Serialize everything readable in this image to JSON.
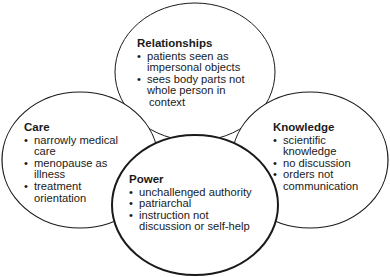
{
  "diagram": {
    "type": "overlapping-circles",
    "nodes": [
      {
        "id": "relationships",
        "title": "Relationships",
        "items": [
          "patients seen as impersonal objects",
          "sees body parts not whole person in context"
        ],
        "lines": [
          [
            "patients seen as",
            "impersonal objects"
          ],
          [
            "sees body parts not",
            "whole person in",
            " context"
          ]
        ]
      },
      {
        "id": "care",
        "title": "Care",
        "items": [
          "narrowly medical care",
          "menopause as illness",
          "treatment orientation"
        ],
        "lines": [
          [
            "narrowly medical",
            "care"
          ],
          [
            "menopause as",
            "illness"
          ],
          [
            "treatment",
            "orientation"
          ]
        ]
      },
      {
        "id": "knowledge",
        "title": "Knowledge",
        "items": [
          "scientific knowledge",
          "no discussion",
          "orders not communication"
        ],
        "lines": [
          [
            "scientific",
            "knowledge"
          ],
          [
            "no discussion"
          ],
          [
            "orders not",
            "communication"
          ]
        ]
      },
      {
        "id": "power",
        "title": "Power",
        "items": [
          "unchallenged authority",
          "patriarchal",
          "instruction not discussion or self-help"
        ],
        "lines": [
          [
            "unchallenged authority"
          ],
          [
            "patriarchal"
          ],
          [
            "instruction not",
            "discussion or self-help"
          ]
        ]
      }
    ],
    "colors": {
      "stroke": "#1a1a1a",
      "fill": "#ffffff",
      "text": "#1a1a1a"
    }
  }
}
